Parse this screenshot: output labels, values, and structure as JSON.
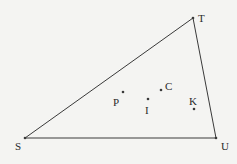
{
  "diagram": {
    "type": "triangle",
    "vertices": [
      {
        "id": "S",
        "label": "S",
        "x": 25,
        "y": 138,
        "lx": 15,
        "ly": 150
      },
      {
        "id": "T",
        "label": "T",
        "x": 193,
        "y": 18,
        "lx": 198,
        "ly": 22
      },
      {
        "id": "U",
        "label": "U",
        "x": 216,
        "y": 138,
        "lx": 221,
        "ly": 150
      }
    ],
    "points": [
      {
        "id": "P",
        "label": "P",
        "x": 123,
        "y": 92,
        "lx": 113,
        "ly": 106
      },
      {
        "id": "I",
        "label": "I",
        "x": 148,
        "y": 99,
        "lx": 145,
        "ly": 114
      },
      {
        "id": "C",
        "label": "C",
        "x": 161,
        "y": 90,
        "lx": 165,
        "ly": 90
      },
      {
        "id": "K",
        "label": "K",
        "x": 194,
        "y": 109,
        "lx": 189,
        "ly": 105
      }
    ],
    "edges": [
      [
        "S",
        "T"
      ],
      [
        "T",
        "U"
      ],
      [
        "U",
        "S"
      ]
    ],
    "colors": {
      "line": "#3a3a3a",
      "text": "#2a2a2a",
      "background": "#f4f4f2"
    }
  }
}
